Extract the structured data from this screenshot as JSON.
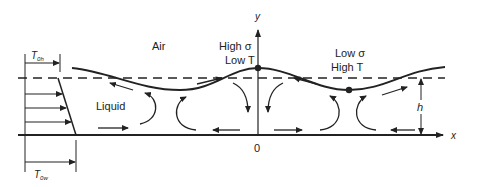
{
  "diagram": {
    "labels": {
      "air": "Air",
      "liquid": "Liquid",
      "peak_line1": "High σ",
      "peak_line2": "Low T",
      "trough_line1": "Low σ",
      "trough_line2": "High T",
      "y_axis": "y",
      "x_axis": "x",
      "origin": "0",
      "thickness": "h",
      "temp_top": "T",
      "temp_top_sub": "0h",
      "temp_bottom": "T",
      "temp_bottom_sub": "0w"
    },
    "colors": {
      "ink": "#222222",
      "background": "#ffffff"
    },
    "elements": [
      "free-surface-curve",
      "mean-level-dashed-line",
      "wall-baseline-x-axis",
      "y-axis",
      "peak-point",
      "trough-point",
      "temperature-profile",
      "flow-arrows",
      "thickness-dimension"
    ]
  }
}
